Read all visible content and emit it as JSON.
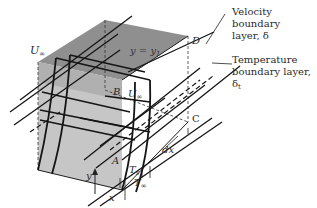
{
  "figure": {
    "callouts": {
      "velocity_bl_line1": "Velocity boundary",
      "velocity_bl_line2": "layer, δ",
      "temperature_bl_line1": "Temperature",
      "temperature_bl_line2": "boundary layer, δ",
      "temperature_bl_sub": "t"
    },
    "labels": {
      "u_inf_left": "U",
      "u_inf_left_sub": "∞",
      "u_inf_mid": "U",
      "u_inf_mid_sub": "∞",
      "top_plane": "y = y",
      "top_plane_sub": "1",
      "point_a": "A",
      "point_b": "B",
      "point_c": "C",
      "point_d": "D",
      "dx": "dx",
      "y_axis": "y",
      "x_axis": "x",
      "t_s": "T",
      "t_s_sub": "s",
      "t_inf": "T",
      "t_inf_sub": "∞"
    },
    "colors": {
      "top_face": "#8a8a8a",
      "front_face": "#c4c4c4",
      "side_face": "#a9a9a9",
      "line": "#1e1e1e"
    }
  }
}
